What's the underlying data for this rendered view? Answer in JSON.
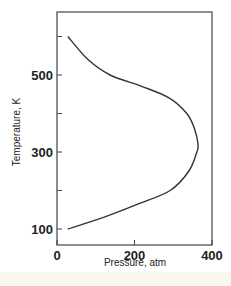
{
  "chart_data": {
    "type": "line",
    "title": "",
    "xlabel": "Pressure, atm",
    "ylabel": "Temperature, K",
    "xlim": [
      0,
      400
    ],
    "ylim": [
      60,
      660
    ],
    "x_ticks": [
      0,
      200,
      400
    ],
    "x_tick_labels": [
      "0",
      "200",
      "400"
    ],
    "y_ticks": [
      100,
      200,
      300,
      400,
      500,
      600
    ],
    "y_tick_labels": [
      "100",
      "",
      "300",
      "",
      "500",
      ""
    ],
    "grid": false,
    "legend": null,
    "series": [
      {
        "name": "curve",
        "points": [
          {
            "x": 28,
            "y": 100
          },
          {
            "x": 120,
            "y": 130
          },
          {
            "x": 210,
            "y": 165
          },
          {
            "x": 292,
            "y": 200
          },
          {
            "x": 340,
            "y": 250
          },
          {
            "x": 361,
            "y": 300
          },
          {
            "x": 364,
            "y": 320
          },
          {
            "x": 355,
            "y": 360
          },
          {
            "x": 335,
            "y": 400
          },
          {
            "x": 290,
            "y": 440
          },
          {
            "x": 220,
            "y": 470
          },
          {
            "x": 137,
            "y": 500
          },
          {
            "x": 80,
            "y": 540
          },
          {
            "x": 28,
            "y": 600
          }
        ]
      }
    ],
    "colors": {
      "line": "#333333",
      "axis": "#444444"
    }
  }
}
